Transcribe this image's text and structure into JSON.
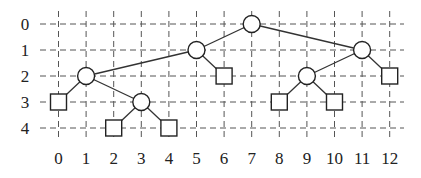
{
  "diagram": {
    "type": "binary-tree-grid",
    "x_axis": {
      "labels": [
        "0",
        "1",
        "2",
        "3",
        "4",
        "5",
        "6",
        "7",
        "8",
        "9",
        "10",
        "11",
        "12"
      ]
    },
    "y_axis": {
      "labels": [
        "0",
        "1",
        "2",
        "3",
        "4"
      ]
    },
    "nodes": [
      {
        "id": "n7_0",
        "x": 7,
        "y": 0,
        "shape": "circle"
      },
      {
        "id": "n5_1",
        "x": 5,
        "y": 1,
        "shape": "circle"
      },
      {
        "id": "n11_1",
        "x": 11,
        "y": 1,
        "shape": "circle"
      },
      {
        "id": "n1_2",
        "x": 1,
        "y": 2,
        "shape": "circle"
      },
      {
        "id": "n6_2",
        "x": 6,
        "y": 2,
        "shape": "square"
      },
      {
        "id": "n9_2",
        "x": 9,
        "y": 2,
        "shape": "circle"
      },
      {
        "id": "n12_2",
        "x": 12,
        "y": 2,
        "shape": "square"
      },
      {
        "id": "n0_3",
        "x": 0,
        "y": 3,
        "shape": "square"
      },
      {
        "id": "n3_3",
        "x": 3,
        "y": 3,
        "shape": "circle"
      },
      {
        "id": "n8_3",
        "x": 8,
        "y": 3,
        "shape": "square"
      },
      {
        "id": "n10_3",
        "x": 10,
        "y": 3,
        "shape": "square"
      },
      {
        "id": "n2_4",
        "x": 2,
        "y": 4,
        "shape": "square"
      },
      {
        "id": "n4_4",
        "x": 4,
        "y": 4,
        "shape": "square"
      }
    ],
    "edges": [
      [
        "n7_0",
        "n5_1"
      ],
      [
        "n7_0",
        "n11_1"
      ],
      [
        "n5_1",
        "n1_2"
      ],
      [
        "n5_1",
        "n6_2"
      ],
      [
        "n11_1",
        "n9_2"
      ],
      [
        "n11_1",
        "n12_2"
      ],
      [
        "n1_2",
        "n0_3"
      ],
      [
        "n1_2",
        "n3_3"
      ],
      [
        "n3_3",
        "n2_4"
      ],
      [
        "n3_3",
        "n4_4"
      ],
      [
        "n9_2",
        "n8_3"
      ],
      [
        "n9_2",
        "n10_3"
      ]
    ]
  }
}
